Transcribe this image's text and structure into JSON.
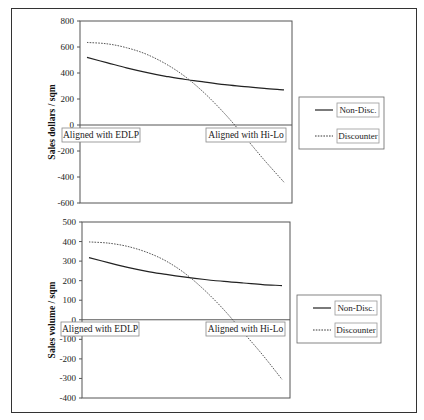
{
  "chart_data": [
    {
      "type": "line",
      "title": "",
      "xlabel": "",
      "ylabel": "Sales dollars / sqm",
      "ylim": [
        -600,
        800
      ],
      "yticks": [
        800,
        600,
        400,
        200,
        0,
        -200,
        -400,
        -600
      ],
      "x_annotations": [
        "Aligned with EDLP",
        "Aligned with Hi-Lo"
      ],
      "x": [
        0,
        0.1,
        0.2,
        0.3,
        0.4,
        0.5,
        0.6,
        0.7,
        0.8,
        0.9,
        1.0
      ],
      "series": [
        {
          "name": "Non-Disc.",
          "style": "solid",
          "values": [
            520,
            480,
            440,
            405,
            375,
            350,
            330,
            310,
            295,
            282,
            270
          ]
        },
        {
          "name": "Discounter",
          "style": "dotted",
          "values": [
            635,
            625,
            595,
            545,
            470,
            370,
            240,
            85,
            -90,
            -270,
            -440
          ]
        }
      ],
      "legend_position": "right",
      "grid": false
    },
    {
      "type": "line",
      "title": "",
      "xlabel": "",
      "ylabel": "Sales volume / sqm",
      "ylim": [
        -400,
        500
      ],
      "yticks": [
        500,
        400,
        300,
        200,
        100,
        0,
        -100,
        -200,
        -300,
        -400
      ],
      "x_annotations": [
        "Aligned with EDLP",
        "Aligned with Hi-Lo"
      ],
      "x": [
        0,
        0.1,
        0.2,
        0.3,
        0.4,
        0.5,
        0.6,
        0.7,
        0.8,
        0.9,
        1.0
      ],
      "series": [
        {
          "name": "Non-Disc.",
          "style": "solid",
          "values": [
            318,
            292,
            268,
            248,
            232,
            218,
            206,
            196,
            188,
            180,
            175
          ]
        },
        {
          "name": "Discounter",
          "style": "dotted",
          "values": [
            398,
            392,
            375,
            345,
            300,
            235,
            150,
            50,
            -65,
            -180,
            -305
          ]
        }
      ],
      "legend_position": "right",
      "grid": false
    }
  ],
  "legend": {
    "non_disc": "Non-Disc.",
    "discounter": "Discounter"
  }
}
